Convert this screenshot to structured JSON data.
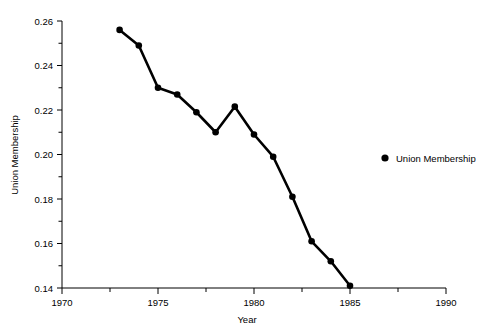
{
  "chart_data": {
    "type": "line",
    "title": "",
    "xlabel": "Year",
    "ylabel": "Union Membership",
    "xlim": [
      1970,
      1990
    ],
    "ylim": [
      0.14,
      0.26
    ],
    "grid": false,
    "legend_position": "right-middle",
    "x_ticks": [
      1970,
      1975,
      1980,
      1985,
      1990
    ],
    "x_tick_labels": [
      "1970",
      "1975",
      "1980",
      "1985",
      "1990"
    ],
    "x_minor_ticks": [
      1972.5,
      1977.5,
      1982.5,
      1987.5
    ],
    "y_ticks": [
      0.14,
      0.16,
      0.18,
      0.2,
      0.22,
      0.24,
      0.26
    ],
    "y_tick_labels": [
      "0.14",
      "0.16",
      "0.18",
      "0.20",
      "0.22",
      "0.24",
      "0.26"
    ],
    "y_minor_ticks": [
      0.15,
      0.17,
      0.19,
      0.21,
      0.23,
      0.25
    ],
    "line_color": "#000000",
    "marker_color": "#000000",
    "series": [
      {
        "name": "Union Membership",
        "x": [
          1973,
          1974,
          1975,
          1976,
          1977,
          1978,
          1979,
          1980,
          1981,
          1982,
          1983,
          1984,
          1985
        ],
        "values": [
          0.256,
          0.249,
          0.23,
          0.227,
          0.219,
          0.21,
          0.2215,
          0.209,
          0.199,
          0.181,
          0.161,
          0.152,
          0.141
        ]
      }
    ]
  },
  "legend": {
    "entries": [
      {
        "label": "Union Membership",
        "marker": "filled-circle",
        "color": "#000000"
      }
    ]
  },
  "axes": {
    "x_title": "Year",
    "y_title": "Union Membership"
  }
}
